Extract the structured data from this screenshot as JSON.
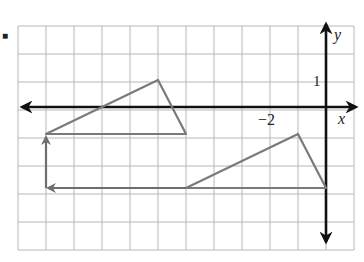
{
  "diagram": {
    "type": "coordinate-grid-translation",
    "bullet": "■",
    "grid": {
      "x_min": -11,
      "x_max": 1,
      "y_min": -5,
      "y_max": 3,
      "cell_px": 28,
      "origin_px": [
        326,
        107
      ],
      "left_px": 18,
      "top_px": 26
    },
    "axes": {
      "x_label": "x",
      "y_label": "y",
      "tick_labels": [
        {
          "axis": "y",
          "value": 1,
          "text": "1"
        },
        {
          "axis": "x",
          "value": -2,
          "text": "−2"
        }
      ]
    },
    "shapes": {
      "preimage_triangle": {
        "vertices": [
          [
            -1,
            -1
          ],
          [
            -5,
            -3
          ],
          [
            0,
            -3
          ]
        ]
      },
      "image_triangle": {
        "vertices": [
          [
            -6,
            1
          ],
          [
            -10,
            -1
          ],
          [
            -5,
            -1
          ]
        ]
      }
    },
    "translation_arrows": [
      {
        "from": [
          -5,
          -3
        ],
        "to": [
          -10,
          -3
        ],
        "direction": "left",
        "units": 5
      },
      {
        "from": [
          -10,
          -3
        ],
        "to": [
          -10,
          -1
        ],
        "direction": "up",
        "units": 2
      }
    ],
    "colors": {
      "grid": "#b8b8b8",
      "axes": "#111111",
      "shapes": "#7a7a7a",
      "background": "#ffffff"
    }
  }
}
